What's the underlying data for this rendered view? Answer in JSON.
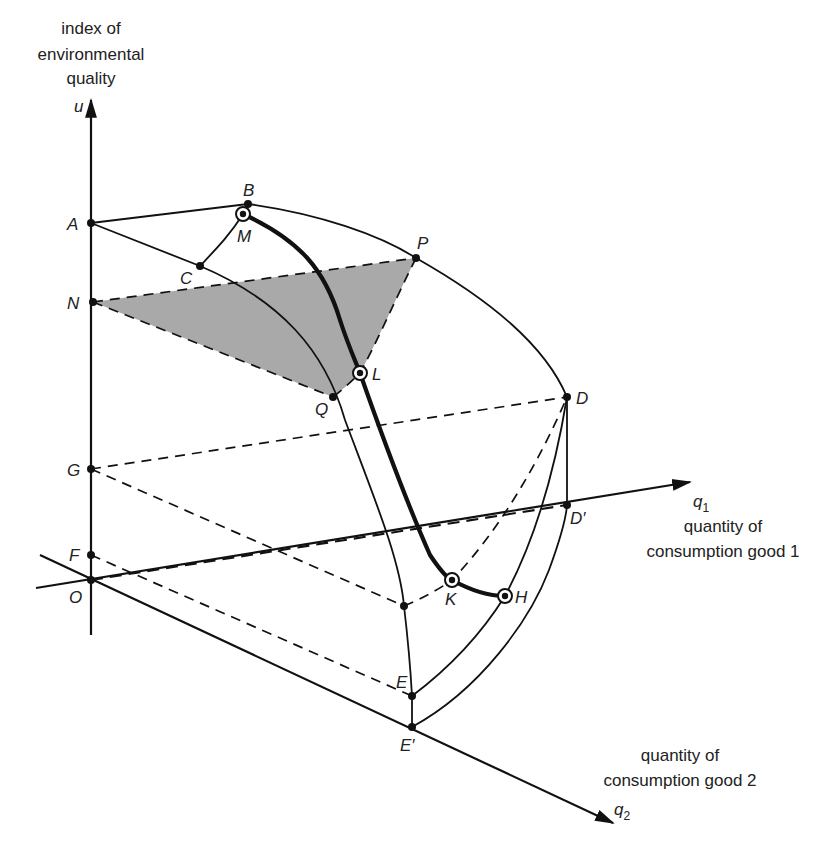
{
  "figure": {
    "type": "3d-economic-diagram",
    "axes": {
      "u": {
        "symbol": "u",
        "caption": [
          "index of",
          "environmental",
          "quality"
        ]
      },
      "q1": {
        "symbol": "q",
        "subscript": "1",
        "caption": [
          "quantity of",
          "consumption good 1"
        ]
      },
      "q2": {
        "symbol": "q",
        "subscript": "2",
        "caption": [
          "quantity of",
          "consumption good 2"
        ]
      }
    },
    "points": {
      "A": "A",
      "B": "B",
      "C": "C",
      "D": "D",
      "D_prime": "D′",
      "E": "E",
      "E_prime": "E′",
      "F": "F",
      "G": "G",
      "H": "H",
      "K": "K",
      "L": "L",
      "M": "M",
      "N": "N",
      "O": "O",
      "P": "P",
      "Q": "Q"
    },
    "shaded_region": "N–P–L–Q",
    "highlighted_path": "M–L–K–H",
    "colors": {
      "ink": "#111111",
      "shade": "#a9a9a9",
      "background": "#ffffff"
    }
  }
}
